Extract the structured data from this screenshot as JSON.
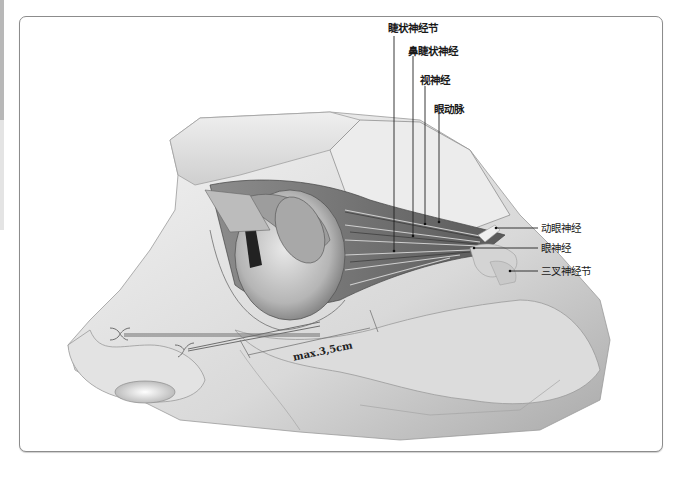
{
  "figure": {
    "type": "anatomical-illustration",
    "labels": {
      "ciliary_ganglion": "睫状神经节",
      "nasociliary_nerve": "鼻睫状神经",
      "optic_nerve": "视神经",
      "ophthalmic_artery": "眼动脉",
      "oculomotor_nerve": "动眼神经",
      "ophthalmic_nerve": "眼神经",
      "trigeminal_ganglion": "三叉神经节"
    },
    "measurement": "max.3,5cm",
    "colors": {
      "frame_border": "#8c8c8c",
      "leader_line": "#222222",
      "skin_shade": "#c8c8c8",
      "background": "#ffffff"
    }
  }
}
